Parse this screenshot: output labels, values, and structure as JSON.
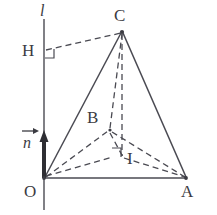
{
  "figure": {
    "kind": "solid-geometry-diagram",
    "width": 217,
    "height": 215,
    "background_color": "#ffffff",
    "stroke_color": "#4a4a52",
    "label_color": "#3b3b42"
  },
  "labels": {
    "line_l": "l",
    "vector_n": "n",
    "point_H": "H",
    "point_C": "C",
    "point_B": "B",
    "point_I": "I",
    "point_O": "O",
    "point_A": "A"
  },
  "points": {
    "O": {
      "x": 44,
      "y": 178
    },
    "A": {
      "x": 186,
      "y": 178
    },
    "B": {
      "x": 110,
      "y": 130
    },
    "C": {
      "x": 122,
      "y": 31
    },
    "I": {
      "x": 122,
      "y": 157
    },
    "H": {
      "x": 44,
      "y": 50
    },
    "l_top": {
      "x": 44,
      "y": 19
    },
    "l_bottom": {
      "x": 44,
      "y": 210
    },
    "n_tip": {
      "x": 44,
      "y": 133
    }
  },
  "edges": [
    {
      "name": "line-l",
      "from": "l_top",
      "to": "l_bottom",
      "style": "solid"
    },
    {
      "name": "edge-OA",
      "from": "O",
      "to": "A",
      "style": "solid"
    },
    {
      "name": "edge-OC",
      "from": "O",
      "to": "C",
      "style": "solid"
    },
    {
      "name": "edge-AC",
      "from": "A",
      "to": "C",
      "style": "solid"
    },
    {
      "name": "edge-OB",
      "from": "O",
      "to": "B",
      "style": "dashed"
    },
    {
      "name": "edge-BC",
      "from": "B",
      "to": "C",
      "style": "dashed"
    },
    {
      "name": "edge-BA",
      "from": "B",
      "to": "A",
      "style": "dashed"
    },
    {
      "name": "edge-CI",
      "from": "C",
      "to": "I",
      "style": "dashed"
    },
    {
      "name": "edge-BI-extended",
      "from": "B",
      "to": "I",
      "style": "dashed"
    },
    {
      "name": "edge-OI-A",
      "from": "O",
      "to": "A",
      "style": "dashed",
      "via": "I-base"
    },
    {
      "name": "edge-HC",
      "from": "H",
      "to": "C",
      "style": "dashed"
    }
  ],
  "right_angle_markers": [
    {
      "name": "right-angle-H",
      "at": "H",
      "size": 9
    },
    {
      "name": "right-angle-I",
      "at": "I",
      "size": 9
    }
  ],
  "vector": {
    "name": "normal-vector-n",
    "label": "n",
    "from": "O",
    "to": "n_tip",
    "style": "thick-arrow"
  }
}
